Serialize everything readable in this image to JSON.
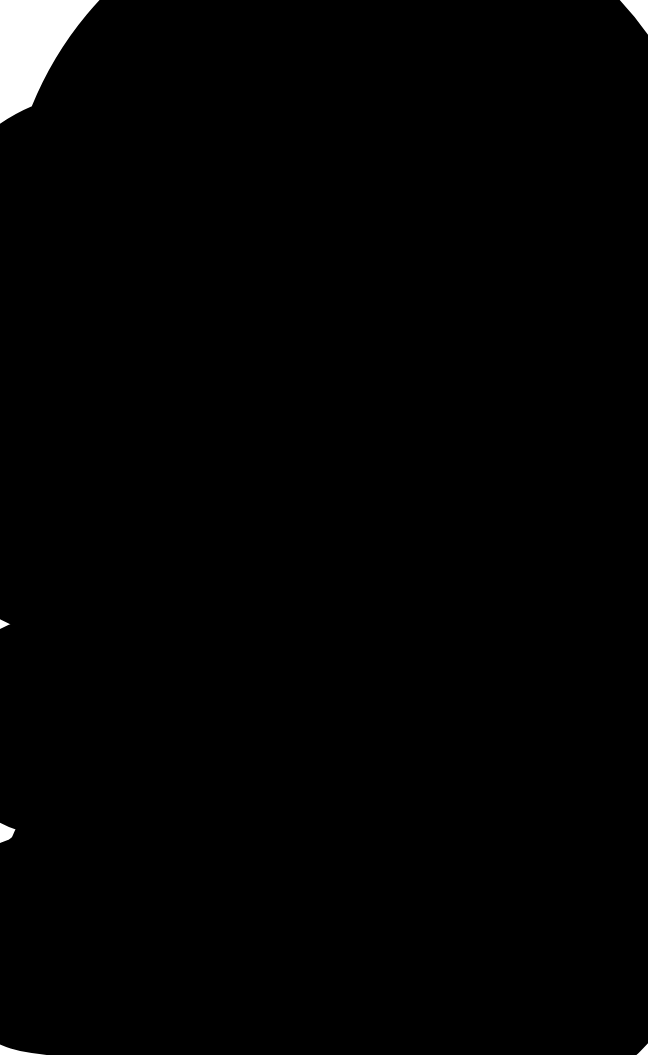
{
  "worksheet": {
    "title_drop": {
      "lines": [
        "Trail",
        "of Tears"
      ]
    },
    "word_drops": [
      {
        "label": "Love"
      },
      {
        "label_lines": [
          "Rule of",
          "Law"
        ]
      },
      {
        "label": "Equality"
      },
      {
        "label": "Rights"
      },
      {
        "label": "Respect"
      },
      {
        "label": "Property"
      }
    ]
  },
  "colors": {
    "outline": "#000000",
    "text": "#000000",
    "background": "#ffffff"
  }
}
